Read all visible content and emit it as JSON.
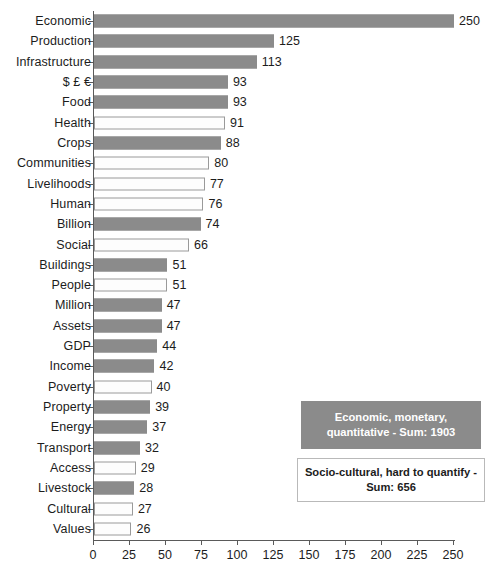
{
  "chart_data": {
    "type": "bar",
    "orientation": "horizontal",
    "title": "",
    "xlabel": "",
    "ylabel": "",
    "xlim": [
      0,
      250
    ],
    "xticks": [
      0,
      25,
      50,
      75,
      100,
      125,
      150,
      175,
      200,
      225,
      250
    ],
    "grid": false,
    "categories": [
      "Economic",
      "Production",
      "Infrastructure",
      "$ £ €",
      "Food",
      "Health",
      "Crops",
      "Communities",
      "Livelihoods",
      "Human",
      "Billion",
      "Social",
      "Buildings",
      "People",
      "Million",
      "Assets",
      "GDP",
      "Income",
      "Poverty",
      "Property",
      "Energy",
      "Transport",
      "Access",
      "Livestock",
      "Cultural",
      "Values"
    ],
    "values": [
      250,
      125,
      113,
      93,
      93,
      91,
      88,
      80,
      77,
      76,
      74,
      66,
      51,
      51,
      47,
      47,
      44,
      42,
      40,
      39,
      37,
      32,
      29,
      28,
      27,
      26
    ],
    "group_by_category": [
      "economic",
      "economic",
      "economic",
      "economic",
      "economic",
      "socio",
      "economic",
      "socio",
      "socio",
      "socio",
      "economic",
      "socio",
      "economic",
      "socio",
      "economic",
      "economic",
      "economic",
      "economic",
      "socio",
      "economic",
      "economic",
      "economic",
      "socio",
      "economic",
      "socio",
      "socio"
    ],
    "series": [
      {
        "name": "Economic, monetary, quantitative",
        "sum": 1903,
        "color": "#8b8b8b",
        "style": "filled"
      },
      {
        "name": "Socio-cultural, hard to quantify",
        "sum": 656,
        "color": "#ffffff",
        "style": "hollow-outline"
      }
    ],
    "legend_position": "inside-lower-right"
  },
  "legend": {
    "economic_label": "Economic, monetary, quantitative - Sum: 1903",
    "socio_label": "Socio-cultural, hard to quantify - Sum: 656"
  },
  "colors": {
    "bar_filled": "#8b8b8b",
    "bar_hollow_fill": "#fdfdfd",
    "bar_hollow_border": "#9a9a9a",
    "axis": "#5a5a5a",
    "text": "#1c1c1c",
    "background": "#ffffff"
  }
}
